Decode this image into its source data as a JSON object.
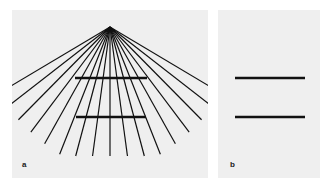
{
  "figure": {
    "panels": [
      {
        "id": "a",
        "label": "a",
        "description": "Ponzo illusion: two equal horizontal bars on converging radial lines",
        "apex": [
          98,
          17
        ],
        "ray_count": 17,
        "bars": [
          {
            "x1": 63,
            "x2": 135,
            "y": 68
          },
          {
            "x1": 64,
            "x2": 134,
            "y": 107
          }
        ]
      },
      {
        "id": "b",
        "label": "b",
        "description": "Same two horizontal bars without background lines",
        "bars": [
          {
            "x1": 17,
            "x2": 87,
            "y": 68
          },
          {
            "x1": 17,
            "x2": 87,
            "y": 107
          }
        ]
      }
    ],
    "colors": {
      "background": "#efefef",
      "ink": "#111111"
    }
  }
}
